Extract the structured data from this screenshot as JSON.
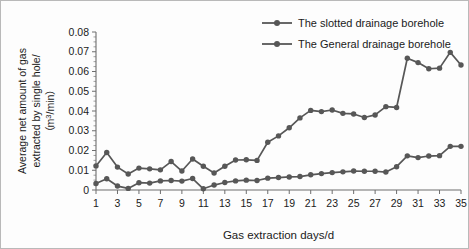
{
  "chart_data": {
    "type": "line",
    "title": "",
    "xlabel": "Gas extraction days/d",
    "ylabel": "Average net amount of gas extracted by single hole/ (m³/min)",
    "ylabel_line1": "Average net amount of gas",
    "ylabel_line2": "extracted by single hole/",
    "ylabel_line3_pre": "（m",
    "ylabel_line3_sup": "3",
    "ylabel_line3_post": "/min）",
    "xlim": [
      1,
      35
    ],
    "ylim": [
      0,
      0.08
    ],
    "grid": false,
    "legend_position": "top-right",
    "x": [
      1,
      2,
      3,
      4,
      5,
      6,
      7,
      8,
      9,
      10,
      11,
      12,
      13,
      14,
      15,
      16,
      17,
      18,
      19,
      20,
      21,
      22,
      23,
      24,
      25,
      26,
      27,
      28,
      29,
      30,
      31,
      32,
      33,
      34,
      35
    ],
    "xtick_labels": [
      "1",
      "3",
      "5",
      "7",
      "9",
      "11",
      "13",
      "15",
      "17",
      "19",
      "21",
      "23",
      "25",
      "27",
      "29",
      "31",
      "33",
      "35"
    ],
    "xtick_values": [
      1,
      3,
      5,
      7,
      9,
      11,
      13,
      15,
      17,
      19,
      21,
      23,
      25,
      27,
      29,
      31,
      33,
      35
    ],
    "ytick_labels": [
      "0",
      "0.01",
      "0.02",
      "0.03",
      "0.04",
      "0.05",
      "0.06",
      "0.07",
      "0.08"
    ],
    "ytick_values": [
      0,
      0.01,
      0.02,
      0.03,
      0.04,
      0.05,
      0.06,
      0.07,
      0.08
    ],
    "series": [
      {
        "name": "The slotted drainage borehole",
        "color": "#575757",
        "marker": "circle",
        "values": [
          0.0122,
          0.019,
          0.0116,
          0.0081,
          0.0111,
          0.0107,
          0.0102,
          0.0144,
          0.0096,
          0.0157,
          0.012,
          0.0086,
          0.012,
          0.0152,
          0.0153,
          0.015,
          0.0242,
          0.0274,
          0.0315,
          0.0365,
          0.0403,
          0.0397,
          0.0405,
          0.0388,
          0.0385,
          0.0367,
          0.038,
          0.0422,
          0.0418,
          0.0667,
          0.0645,
          0.0614,
          0.0617,
          0.0697,
          0.0633
        ]
      },
      {
        "name": "The General drainage borehole",
        "color": "#575757",
        "marker": "circle",
        "values": [
          0.0033,
          0.0057,
          0.002,
          0.0008,
          0.0037,
          0.0035,
          0.0046,
          0.0048,
          0.0045,
          0.0058,
          0.0006,
          0.0025,
          0.0038,
          0.0046,
          0.005,
          0.0048,
          0.006,
          0.0063,
          0.0066,
          0.0068,
          0.0077,
          0.0083,
          0.0088,
          0.0092,
          0.0096,
          0.0095,
          0.0095,
          0.0091,
          0.0118,
          0.0173,
          0.0164,
          0.0172,
          0.0174,
          0.0221,
          0.0221
        ]
      }
    ]
  },
  "legend": {
    "items": [
      {
        "label": "The slotted drainage borehole"
      },
      {
        "label": "The General drainage borehole"
      }
    ]
  }
}
